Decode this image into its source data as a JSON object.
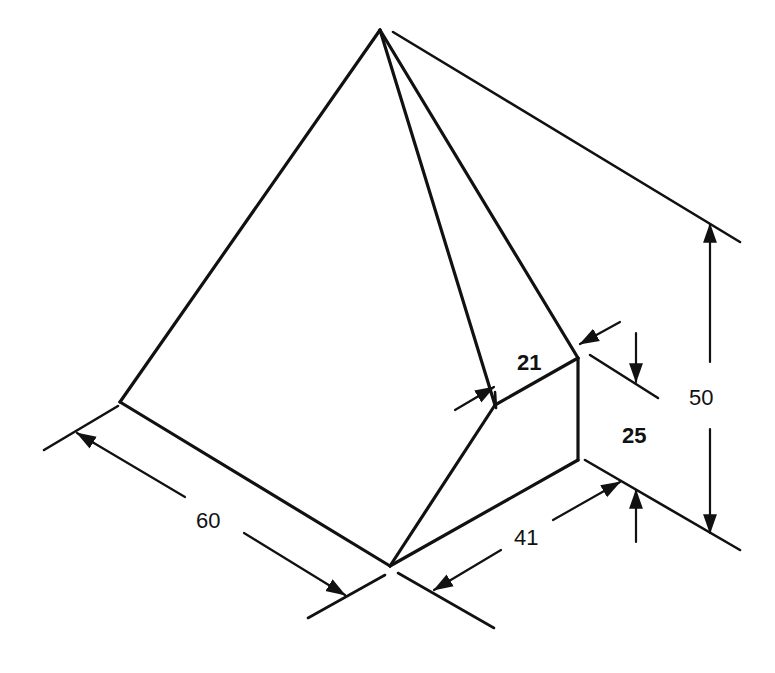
{
  "drawing": {
    "type": "isometric engineering drawing",
    "object": "pyramid with truncated corner",
    "dimensions": [
      {
        "id": "dim-60",
        "label": "60"
      },
      {
        "id": "dim-41",
        "label": "41"
      },
      {
        "id": "dim-21",
        "label": "21"
      },
      {
        "id": "dim-25",
        "label": "25"
      },
      {
        "id": "dim-50",
        "label": "50"
      }
    ]
  }
}
